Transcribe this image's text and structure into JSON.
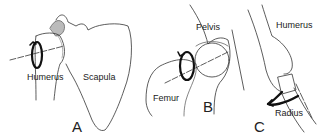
{
  "panels": [
    {
      "letter": "A",
      "labels": {
        "bone1": "Humerus",
        "bone2": "Scapula"
      }
    },
    {
      "letter": "B",
      "labels": {
        "bone1": "Pelvis",
        "bone2": "Femur"
      }
    },
    {
      "letter": "C",
      "labels": {
        "bone1": "Humerus",
        "bone2": "Radius"
      }
    }
  ]
}
